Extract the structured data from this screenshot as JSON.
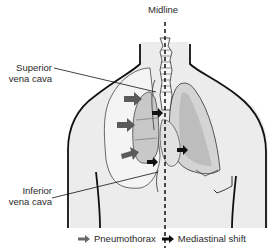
{
  "diagram": {
    "labels": {
      "midline": "Midline",
      "superior_vena_cava_line1": "Superior",
      "superior_vena_cava_line2": "vena cava",
      "inferior_vena_cava_line1": "Inferior",
      "inferior_vena_cava_line2": "vena cava"
    },
    "legend": [
      {
        "label": "Pneumothorax",
        "icon": "arrow-right-icon",
        "color": "#6a6a6a"
      },
      {
        "label": "Mediastinal shift",
        "icon": "arrow-right-icon",
        "color": "#111111"
      }
    ],
    "colors": {
      "body_fill": "#ececec",
      "outline": "#111111",
      "lung_fill": "#cfcfcf",
      "lung_shade": "#b0b0b0",
      "pneumothorax_arrow": "#5a5a5a",
      "mediastinal_arrow": "#111111"
    }
  }
}
